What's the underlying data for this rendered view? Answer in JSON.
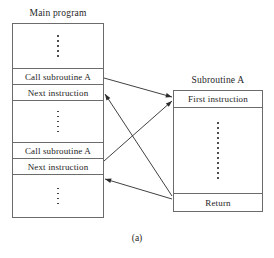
{
  "figure": {
    "caption": "(a)",
    "line_color": "#6b6b6b",
    "arrow_color": "#2b2b2b",
    "text_color": "#1d1d1d"
  },
  "main_program": {
    "title": "Main program",
    "rows": [
      {
        "kind": "ellipsis",
        "label": "",
        "dots": 5
      },
      {
        "kind": "instruction",
        "label": "Call subroutine A"
      },
      {
        "kind": "instruction",
        "label": "Next instruction"
      },
      {
        "kind": "ellipsis",
        "label": "",
        "dots": 5
      },
      {
        "kind": "instruction",
        "label": "Call subroutine A"
      },
      {
        "kind": "instruction",
        "label": "Next instruction"
      },
      {
        "kind": "ellipsis",
        "label": "",
        "dots": 4
      }
    ]
  },
  "subroutine": {
    "title": "Subroutine A",
    "rows": [
      {
        "kind": "instruction",
        "label": "First instruction"
      },
      {
        "kind": "ellipsis",
        "label": "",
        "dots": 12
      },
      {
        "kind": "instruction",
        "label": "Return"
      }
    ]
  },
  "arrows": [
    {
      "name": "call-1-to-first-instruction",
      "from": "Call subroutine A (first)",
      "to": "First instruction",
      "x1": 104,
      "y1": 78,
      "x2": 172,
      "y2": 97
    },
    {
      "name": "return-to-next-instruction-1",
      "from": "Return",
      "to": "Next instruction (first)",
      "x1": 172,
      "y1": 196,
      "x2": 105,
      "y2": 94
    },
    {
      "name": "call-2-to-first-instruction",
      "from": "Call subroutine A (second)",
      "to": "First instruction",
      "x1": 104,
      "y1": 161,
      "x2": 172,
      "y2": 101
    },
    {
      "name": "return-to-next-instruction-2",
      "from": "Return",
      "to": "Next instruction (second)",
      "x1": 172,
      "y1": 199,
      "x2": 105,
      "y2": 179
    }
  ]
}
